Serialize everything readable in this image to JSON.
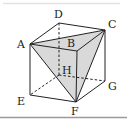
{
  "figure": {
    "type": "cube",
    "vertices": {
      "A": [
        30,
        44
      ],
      "B": [
        77,
        51
      ],
      "C": [
        105,
        30
      ],
      "D": [
        59,
        23
      ],
      "E": [
        30,
        95
      ],
      "F": [
        76,
        102
      ],
      "G": [
        105,
        81
      ],
      "H": [
        59,
        75
      ]
    },
    "labels": [
      {
        "id": "A",
        "text": "A",
        "x": 17,
        "y": 44
      },
      {
        "id": "B",
        "text": "B",
        "x": 66,
        "y": 46
      },
      {
        "id": "C",
        "text": "C",
        "x": 108,
        "y": 27
      },
      {
        "id": "D",
        "text": "D",
        "x": 54,
        "y": 17
      },
      {
        "id": "H",
        "text": "H",
        "x": 62,
        "y": 73
      },
      {
        "id": "G",
        "text": "G",
        "x": 108,
        "y": 90
      },
      {
        "id": "E",
        "text": "E",
        "x": 17,
        "y": 104
      },
      {
        "id": "F",
        "text": "F",
        "x": 71,
        "y": 117
      }
    ],
    "shaded_face": [
      "A",
      "C",
      "F"
    ],
    "hidden_edges": [
      [
        "D",
        "H"
      ],
      [
        "H",
        "E"
      ],
      [
        "H",
        "G"
      ]
    ],
    "colors": {
      "shade": "#d9d9d9",
      "line": "#222222",
      "frame": "#9a9a9a"
    }
  }
}
